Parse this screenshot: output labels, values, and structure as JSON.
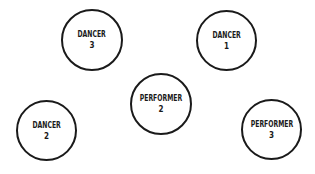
{
  "nodes": [
    {
      "id": "dancer-3",
      "label": "DANCER",
      "number": "3",
      "cx": 92,
      "cy": 40,
      "d": 62
    },
    {
      "id": "dancer-1",
      "label": "DANCER",
      "number": "1",
      "cx": 226,
      "cy": 41,
      "d": 61
    },
    {
      "id": "performer-2",
      "label": "PERFORMER",
      "number": "2",
      "cx": 161,
      "cy": 104,
      "d": 62
    },
    {
      "id": "dancer-2",
      "label": "DANCER",
      "number": "2",
      "cx": 46,
      "cy": 131,
      "d": 61
    },
    {
      "id": "performer-3",
      "label": "PERFORMER",
      "number": "3",
      "cx": 271,
      "cy": 130,
      "d": 61
    }
  ],
  "colors": {
    "stroke": "#1a1a1a",
    "background": "#ffffff",
    "text": "#1a1a1a"
  }
}
